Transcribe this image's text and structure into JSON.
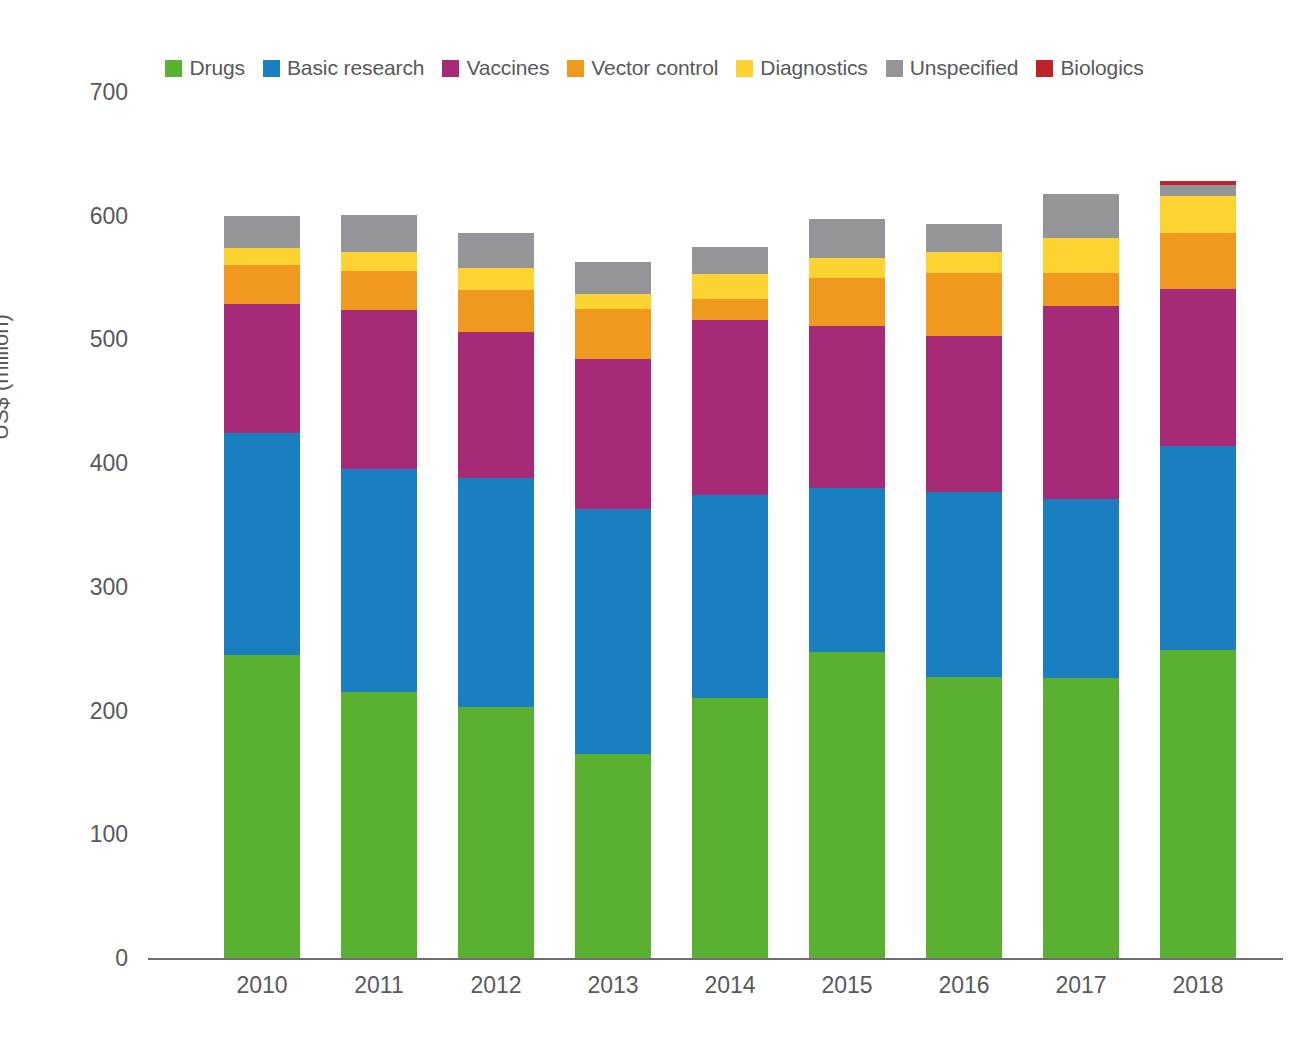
{
  "chart_data": {
    "type": "bar",
    "stacked": true,
    "title": "",
    "xlabel": "",
    "ylabel": "US$ (million)",
    "ylim": [
      0,
      700
    ],
    "yticks": [
      0,
      100,
      200,
      300,
      400,
      500,
      600,
      700
    ],
    "ytick_labels": [
      "0",
      "100",
      "200",
      "300",
      "400",
      "500",
      "600",
      "700"
    ],
    "grid": false,
    "legend_position": "top",
    "categories": [
      "2010",
      "2011",
      "2012",
      "2013",
      "2014",
      "2015",
      "2016",
      "2017",
      "2018"
    ],
    "series": [
      {
        "name": "Drugs",
        "color": "#5ab031",
        "values": [
          245,
          215,
          203,
          165,
          210,
          247,
          227,
          226,
          249
        ]
      },
      {
        "name": "Basic research",
        "color": "#1a7fc1",
        "values": [
          179,
          180,
          185,
          198,
          164,
          133,
          150,
          145,
          165
        ]
      },
      {
        "name": "Vaccines",
        "color": "#a72a76",
        "values": [
          105,
          129,
          118,
          121,
          142,
          131,
          126,
          156,
          127
        ]
      },
      {
        "name": "Vector control",
        "color": "#ef9a1e",
        "values": [
          31,
          31,
          34,
          41,
          17,
          39,
          51,
          27,
          45
        ]
      },
      {
        "name": "Diagnostics",
        "color": "#fcd330",
        "values": [
          14,
          16,
          18,
          12,
          20,
          16,
          17,
          28,
          30
        ]
      },
      {
        "name": "Unspecified",
        "color": "#939598",
        "values": [
          26,
          30,
          28,
          26,
          22,
          31,
          22,
          36,
          9
        ]
      },
      {
        "name": "Biologics",
        "color": "#c0222a",
        "values": [
          0,
          0,
          0,
          0,
          0,
          0,
          0,
          0,
          3
        ]
      }
    ],
    "totals": [
      600,
      621,
      586,
      563,
      575,
      597,
      593,
      618,
      628
    ]
  },
  "axis": {
    "y_title": "US$ (million)"
  }
}
